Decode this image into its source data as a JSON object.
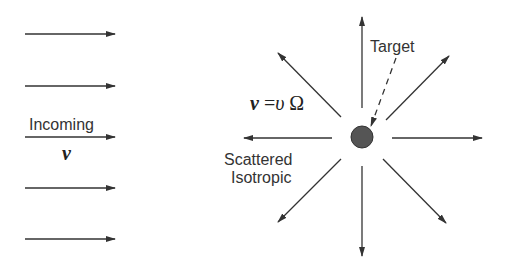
{
  "diagram": {
    "type": "isotropic-scattering",
    "incoming": {
      "label": "Incoming",
      "velocity_symbol": "v",
      "arrow_count": 5,
      "direction": "right"
    },
    "target": {
      "label": "Target",
      "color": "#555555"
    },
    "scattered": {
      "label_line1": "Scattered",
      "label_line2": "Isotropic",
      "equation_lhs": "v",
      "equation_eq": " =",
      "equation_rhs_v": "υ",
      "equation_rhs_omega": " Ω",
      "arrow_count": 8
    },
    "colors": {
      "line": "#333333",
      "background": "#ffffff"
    }
  }
}
